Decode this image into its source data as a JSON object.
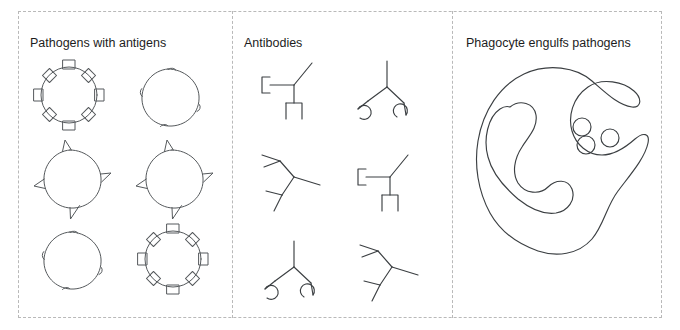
{
  "figure": {
    "width": 680,
    "height": 330,
    "background_color": "#ffffff",
    "frame_border_color": "#b9b9b9",
    "ink_color": "#55595c",
    "text_color": "#1d1d1d",
    "clipped_top_caption": ""
  },
  "panels": [
    {
      "id": "pathogens",
      "title": "Pathogens with antigens",
      "items": [
        {
          "name": "pathogen-square-antigens-1",
          "antigen_shape": "square",
          "antigen_count": 8,
          "row": 1,
          "col": 1
        },
        {
          "name": "pathogen-bump-antigens-1",
          "antigen_shape": "bump",
          "antigen_count": 4,
          "row": 1,
          "col": 2
        },
        {
          "name": "pathogen-spike-antigens-1",
          "antigen_shape": "triangle",
          "antigen_count": 4,
          "row": 2,
          "col": 1
        },
        {
          "name": "pathogen-spike-antigens-2",
          "antigen_shape": "triangle",
          "antigen_count": 4,
          "row": 2,
          "col": 2
        },
        {
          "name": "pathogen-bump-antigens-2",
          "antigen_shape": "bump",
          "antigen_count": 4,
          "row": 3,
          "col": 1
        },
        {
          "name": "pathogen-square-antigens-2",
          "antigen_shape": "square",
          "antigen_count": 8,
          "row": 3,
          "col": 2
        }
      ]
    },
    {
      "id": "antibodies",
      "title": "Antibodies",
      "items": [
        {
          "name": "antibody-bracket-1",
          "binding_site_shape": "bracket",
          "row": 1,
          "col": 1
        },
        {
          "name": "antibody-hook-1",
          "binding_site_shape": "hook",
          "row": 1,
          "col": 2
        },
        {
          "name": "antibody-fork-1",
          "binding_site_shape": "fork",
          "row": 2,
          "col": 1
        },
        {
          "name": "antibody-bracket-2",
          "binding_site_shape": "bracket",
          "row": 2,
          "col": 2
        },
        {
          "name": "antibody-hook-2",
          "binding_site_shape": "hook",
          "row": 3,
          "col": 1
        },
        {
          "name": "antibody-fork-2",
          "binding_site_shape": "fork",
          "row": 3,
          "col": 2
        }
      ]
    },
    {
      "id": "phagocyte",
      "title": "Phagocyte engulfs pathogens",
      "items": [
        {
          "name": "phagocyte-cell",
          "shape": "amoeboid-outline"
        },
        {
          "name": "phagocyte-vacuole",
          "shape": "internal-loop"
        },
        {
          "name": "engulfed-pathogen-1",
          "shape": "circle"
        },
        {
          "name": "engulfed-pathogen-2",
          "shape": "circle"
        },
        {
          "name": "engulfed-pathogen-3",
          "shape": "circle"
        }
      ]
    }
  ]
}
